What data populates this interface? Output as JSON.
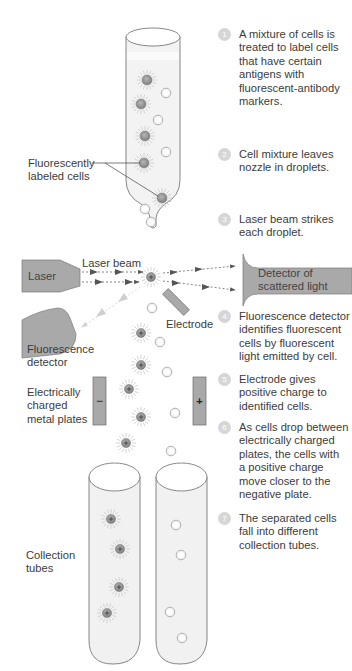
{
  "diagram": {
    "colors": {
      "tube_fill": "#f1f1f1",
      "tube_stroke": "#6a6a6a",
      "device_fill": "#a9a9a9",
      "device_stroke": "#7a7a7a",
      "labeled_cell": "#8c8c8c",
      "unlabeled_cell": "#ffffff",
      "step_badge": "#d6d6d6",
      "beam_arrow": "#555555",
      "fluor_arrow": "#c8c8c8"
    }
  },
  "labels": {
    "fluorescently_labeled_cells": "Fluorescently\nlabeled cells",
    "laser": "Laser",
    "laser_beam": "Laser beam",
    "detector_scattered": "Detector of\nscattered light",
    "electrode": "Electrode",
    "fluorescence_detector": "Fluorescence\ndetector",
    "charged_plates": "Electrically\ncharged\nmetal plates",
    "collection_tubes": "Collection\ntubes",
    "plate_negative": "−",
    "plate_positive": "+"
  },
  "steps": [
    {
      "num": "1",
      "text": "A mixture of cells is\ntreated to label cells\nthat have certain\nantigens with\nfluorescent-antibody\nmarkers."
    },
    {
      "num": "2",
      "text": "Cell mixture leaves\nnozzle in droplets."
    },
    {
      "num": "3",
      "text": "Laser beam strikes\neach droplet."
    },
    {
      "num": "4",
      "text": "Fluorescence detector\nidentifies fluorescent\ncells by fluorescent\nlight emitted by cell."
    },
    {
      "num": "5",
      "text": "Electrode gives\npositive charge to\nidentified cells."
    },
    {
      "num": "6",
      "text": "As cells drop between\nelectrically charged\nplates, the cells with\na positive charge\nmove closer to the\nnegative plate."
    },
    {
      "num": "7",
      "text": "The separated cells\nfall into different\ncollection tubes."
    }
  ]
}
